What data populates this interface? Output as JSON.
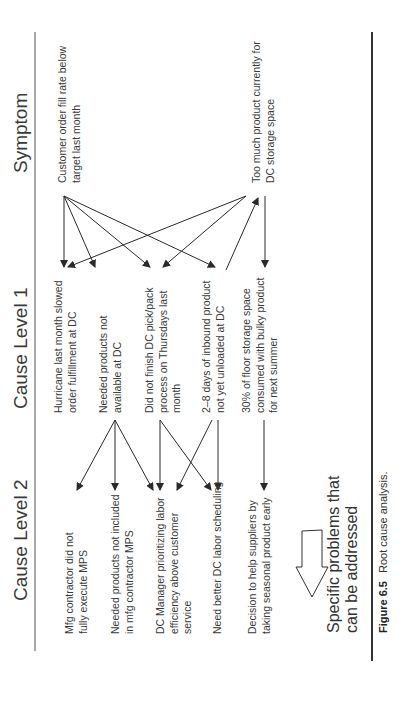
{
  "headers": {
    "symptom": "Symptom",
    "cause_level_1": "Cause Level 1",
    "cause_level_2": "Cause Level 2"
  },
  "symptoms": [
    {
      "id": "S1",
      "lines": [
        "Customer order fill rate below",
        "target last month"
      ]
    },
    {
      "id": "S2",
      "lines": [
        "Too much product currently for",
        "DC storage space"
      ]
    }
  ],
  "cause_level_1": [
    {
      "id": "C1a",
      "lines": [
        "Hurricane last month slowed",
        "order fulfillment at DC"
      ]
    },
    {
      "id": "C1b",
      "lines": [
        "Needed products not",
        "available at DC"
      ]
    },
    {
      "id": "C1c",
      "lines": [
        "Did not finish DC pick/pack",
        "process on Thursdays last",
        "month"
      ]
    },
    {
      "id": "C1d",
      "lines": [
        "2–8 days of inbound product",
        "not yet unloaded at DC"
      ]
    },
    {
      "id": "C1e",
      "lines": [
        "30% of floor storage space",
        "consumed with bulky product",
        "for next summer"
      ]
    }
  ],
  "cause_level_2": [
    {
      "id": "C2a",
      "lines": [
        "Mfg contractor did not",
        "fully execute MPS"
      ]
    },
    {
      "id": "C2b",
      "lines": [
        "Needed products not included",
        "in mfg contractor MPS"
      ]
    },
    {
      "id": "C2c",
      "lines": [
        "DC Manager prioritizing labor",
        "efficiency above customer",
        "service"
      ]
    },
    {
      "id": "C2d",
      "lines": [
        "Need better DC labor scheduling"
      ]
    },
    {
      "id": "C2e",
      "lines": [
        "Decision to help suppliers by",
        "taking seasonal product early"
      ]
    }
  ],
  "arrow_note": {
    "lines": [
      "Specific problems that",
      "can be addressed"
    ],
    "icon": "left-arrow-outline-icon"
  },
  "caption": {
    "label": "Figure 6.5",
    "text": "Root cause analysis."
  },
  "links": [
    {
      "from": "S1",
      "to": "C1a"
    },
    {
      "from": "S1",
      "to": "C1b"
    },
    {
      "from": "S1",
      "to": "C1c"
    },
    {
      "from": "S1",
      "to": "C1d"
    },
    {
      "from": "S2",
      "to": "C1a"
    },
    {
      "from": "S2",
      "to": "C1c"
    },
    {
      "from": "C1d",
      "to": "S2"
    },
    {
      "from": "S2",
      "to": "C1e"
    },
    {
      "from": "C1b",
      "to": "C2a"
    },
    {
      "from": "C1b",
      "to": "C2b"
    },
    {
      "from": "C1b",
      "to": "C2c"
    },
    {
      "from": "C1c",
      "to": "C2c"
    },
    {
      "from": "C1c",
      "to": "C2d"
    },
    {
      "from": "C1d",
      "to": "C2c"
    },
    {
      "from": "C1d",
      "to": "C2d"
    },
    {
      "from": "C1e",
      "to": "C2e"
    }
  ]
}
